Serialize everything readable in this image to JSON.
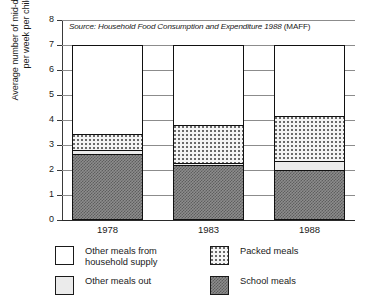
{
  "chart_data": {
    "type": "bar",
    "subtype": "stacked-bar",
    "title": "",
    "source_note": "Source: Household Food Consumption and Expenditure 1988 (MAFF)",
    "source_note_italic": "Source: Household Food Consumption and Expenditure 1988",
    "source_note_plain": " (MAFF)",
    "xlabel": "",
    "ylabel": "Average number of mid-day meals per week per child",
    "ylabel_line1": "Average number of mid-day meals",
    "ylabel_line2": "per week per child",
    "categories": [
      "1978",
      "1983",
      "1988"
    ],
    "ylim": [
      0,
      8
    ],
    "yticks": [
      "0",
      "1",
      "2",
      "3",
      "4",
      "5",
      "6",
      "7",
      "8"
    ],
    "grid": true,
    "legend_position": "bottom",
    "stack_order_bottom_to_top": [
      "School meals",
      "Other meals out",
      "Packed meals",
      "Other meals from household supply"
    ],
    "series": [
      {
        "name": "School meals",
        "values": [
          2.65,
          2.2,
          2.0
        ]
      },
      {
        "name": "Other meals out",
        "values": [
          0.15,
          0.1,
          0.35
        ]
      },
      {
        "name": "Packed meals",
        "values": [
          0.65,
          1.5,
          1.8
        ]
      },
      {
        "name": "Other meals from household supply",
        "values": [
          3.55,
          3.2,
          2.85
        ]
      }
    ],
    "cumulative_tops": {
      "1978": {
        "school": 2.65,
        "other_out": 2.8,
        "packed": 3.45,
        "household": 7.0
      },
      "1983": {
        "school": 2.2,
        "other_out": 2.3,
        "packed": 3.8,
        "household": 7.0
      },
      "1988": {
        "school": 2.0,
        "other_out": 2.35,
        "packed": 4.15,
        "household": 7.0
      }
    },
    "totals": [
      7.0,
      7.0,
      7.0
    ]
  },
  "legend": {
    "items": [
      {
        "label": "Other meals from\nhousehold supply",
        "swatch": "household-supply-swatch",
        "color": "#ffffff"
      },
      {
        "label": "Packed meals",
        "swatch": "packed-meals-swatch",
        "color": "#f4f4f4"
      },
      {
        "label": "Other meals out",
        "swatch": "other-meals-out-swatch",
        "color": "#ebebeb"
      },
      {
        "label": "School meals",
        "swatch": "school-meals-swatch",
        "color": "#8d8d8d"
      }
    ]
  },
  "axis": {
    "y_ticks": [
      "8",
      "7",
      "6",
      "5",
      "4",
      "3",
      "2",
      "1",
      "0"
    ],
    "x_ticks": [
      "1978",
      "1983",
      "1988"
    ]
  }
}
